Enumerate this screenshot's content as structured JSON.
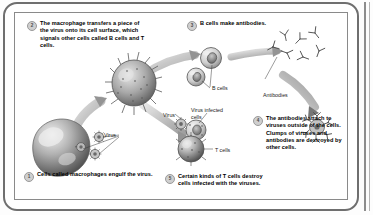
{
  "diagram": {
    "steps": [
      {
        "number": "1",
        "text": "Cells called macrophages engulf the virus."
      },
      {
        "number": "2",
        "text": "The macrophage transfers a piece of the virus onto its cell surface, which signals other cells called B cells and T cells."
      },
      {
        "number": "3",
        "text": "B cells make antibodies."
      },
      {
        "number": "4",
        "text": "The antibodies attach to viruses outside of the cells. Clumps of viruses and antibodies are destroyed by other cells."
      },
      {
        "number": "5",
        "text": "Certain kinds of T cells destroy cells infected with the viruses."
      }
    ],
    "labels": {
      "virus_left": "Virus",
      "virus_mid": "Virus",
      "virus_infected_cells": "Virus infected cells",
      "b_cells": "B cells",
      "t_cells": "T cells",
      "antibodies": "Antibodies"
    },
    "colors": {
      "frame": "#6f6f6f",
      "inner_frame": "#8a8a8a",
      "badge_fill": "#cfcfcf",
      "badge_border": "#9a9a9a",
      "arrow": "#c9c9c9",
      "cell_dark": "#6b6b6b",
      "cell_light": "#d4d4d4",
      "background": "#ffffff"
    }
  }
}
